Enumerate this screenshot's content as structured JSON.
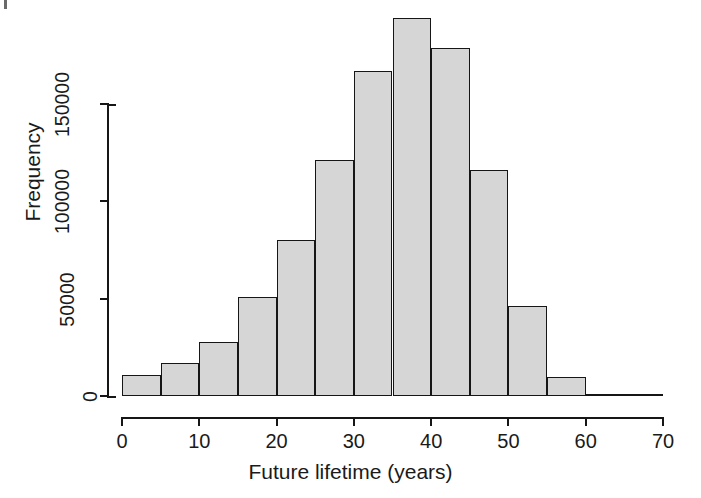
{
  "chart_data": {
    "type": "bar",
    "subtype": "histogram",
    "title": "",
    "xlabel": "Future lifetime (years)",
    "ylabel": "Frequency",
    "xlim": [
      0,
      70
    ],
    "ylim": [
      0,
      195000
    ],
    "grid": false,
    "legend": null,
    "bin_width": 5,
    "bar_fill_color": "#d6d6d6",
    "bar_border_color": "#161616",
    "x_ticks": [
      0,
      10,
      20,
      30,
      40,
      50,
      60,
      70
    ],
    "x_tick_labels": [
      "0",
      "10",
      "20",
      "30",
      "40",
      "50",
      "60",
      "70"
    ],
    "y_ticks": [
      0,
      50000,
      100000,
      150000
    ],
    "y_tick_labels": [
      "0",
      "50000",
      "100000",
      "150000"
    ],
    "bins": [
      {
        "x0": 0,
        "x1": 5,
        "label": "0-5",
        "value": 11000
      },
      {
        "x0": 5,
        "x1": 10,
        "label": "5-10",
        "value": 17000
      },
      {
        "x0": 10,
        "x1": 15,
        "label": "10-15",
        "value": 28000
      },
      {
        "x0": 15,
        "x1": 20,
        "label": "15-20",
        "value": 51000
      },
      {
        "x0": 20,
        "x1": 25,
        "label": "20-25",
        "value": 80000
      },
      {
        "x0": 25,
        "x1": 30,
        "label": "25-30",
        "value": 121000
      },
      {
        "x0": 30,
        "x1": 35,
        "label": "30-35",
        "value": 167000
      },
      {
        "x0": 35,
        "x1": 40,
        "label": "35-40",
        "value": 194000
      },
      {
        "x0": 40,
        "x1": 45,
        "label": "40-45",
        "value": 179000
      },
      {
        "x0": 45,
        "x1": 50,
        "label": "45-50",
        "value": 116000
      },
      {
        "x0": 50,
        "x1": 55,
        "label": "50-55",
        "value": 46000
      },
      {
        "x0": 55,
        "x1": 60,
        "label": "55-60",
        "value": 10000
      },
      {
        "x0": 60,
        "x1": 65,
        "label": "60-65",
        "value": 1000
      },
      {
        "x0": 65,
        "x1": 70,
        "label": "65-70",
        "value": 0
      }
    ],
    "categories": [
      "0-5",
      "5-10",
      "10-15",
      "15-20",
      "20-25",
      "25-30",
      "30-35",
      "35-40",
      "40-45",
      "45-50",
      "50-55",
      "55-60",
      "60-65",
      "65-70"
    ],
    "values": [
      11000,
      17000,
      28000,
      51000,
      80000,
      121000,
      167000,
      194000,
      179000,
      116000,
      46000,
      10000,
      1000,
      0
    ]
  }
}
